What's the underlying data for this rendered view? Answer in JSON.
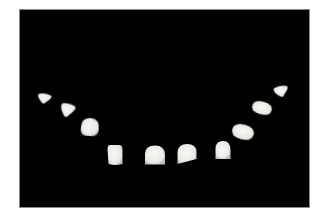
{
  "image": {
    "description": "Photograph of a set of ten dental porcelain veneers arranged in a U-shaped arch on a black background",
    "background_color": "#000000",
    "frame_color": "#ffffff",
    "veneer_color": "#e8e8e4",
    "veneer_count": 10
  },
  "veneers": [
    {
      "id": "left-2nd-premolar",
      "cx": 44,
      "cy": 99,
      "w": 15,
      "h": 11,
      "shape": "triangle-round",
      "rot": 10
    },
    {
      "id": "left-1st-premolar",
      "cx": 67,
      "cy": 111,
      "w": 16,
      "h": 15,
      "shape": "triangle-round",
      "rot": 15
    },
    {
      "id": "left-canine",
      "cx": 90,
      "cy": 127,
      "w": 18,
      "h": 18,
      "shape": "cone",
      "rot": 5
    },
    {
      "id": "left-lateral-incisor",
      "cx": 115,
      "cy": 155,
      "w": 15,
      "h": 20,
      "shape": "rect-round",
      "rot": 0
    },
    {
      "id": "left-central-incisor",
      "cx": 155,
      "cy": 155,
      "w": 20,
      "h": 19,
      "shape": "dome",
      "rot": 0
    },
    {
      "id": "right-central-incisor",
      "cx": 187,
      "cy": 154,
      "w": 19,
      "h": 20,
      "shape": "dome-slant",
      "rot": 0
    },
    {
      "id": "right-lateral-incisor",
      "cx": 223,
      "cy": 150,
      "w": 15,
      "h": 18,
      "shape": "dome",
      "rot": 0
    },
    {
      "id": "right-canine",
      "cx": 243,
      "cy": 132,
      "w": 22,
      "h": 15,
      "shape": "oval",
      "rot": 15
    },
    {
      "id": "right-1st-premolar",
      "cx": 262,
      "cy": 108,
      "w": 20,
      "h": 13,
      "shape": "oval",
      "rot": 15
    },
    {
      "id": "right-2nd-premolar",
      "cx": 281,
      "cy": 92,
      "w": 16,
      "h": 12,
      "shape": "triangle-round",
      "rot": -10
    }
  ]
}
